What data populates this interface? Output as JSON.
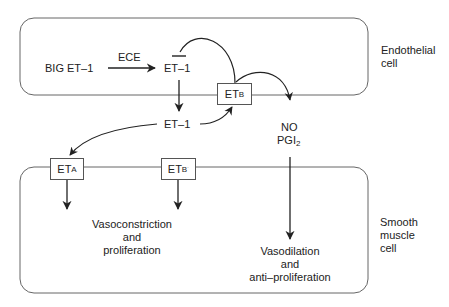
{
  "diagram": {
    "compartments": {
      "endothelial": {
        "label_line1": "Endothelial",
        "label_line2": "cell"
      },
      "smooth_muscle": {
        "label_line1": "Smooth",
        "label_line2": "muscle",
        "label_line3": "cell"
      }
    },
    "nodes": {
      "big_et1": "BIG ET–1",
      "ece": "ECE",
      "et1_intracellular": "ET–1",
      "et1_extracellular": "ET–1",
      "no": "NO",
      "pgi2_base": "PGI",
      "pgi2_sub": "2"
    },
    "receptors": {
      "etb_endothelial": {
        "base": "ET",
        "sub": "B"
      },
      "eta_smooth": {
        "base": "ET",
        "sub": "A"
      },
      "etb_smooth": {
        "base": "ET",
        "sub": "B",
        "sup": "˙"
      }
    },
    "effects": {
      "constriction": {
        "line1": "Vasoconstriction",
        "line2": "and",
        "line3": "proliferation"
      },
      "dilation": {
        "line1": "Vasodilation",
        "line2": "and",
        "line3": "anti–proliferation"
      }
    },
    "colors": {
      "line": "#222222",
      "border": "#555555",
      "background": "#ffffff"
    }
  }
}
